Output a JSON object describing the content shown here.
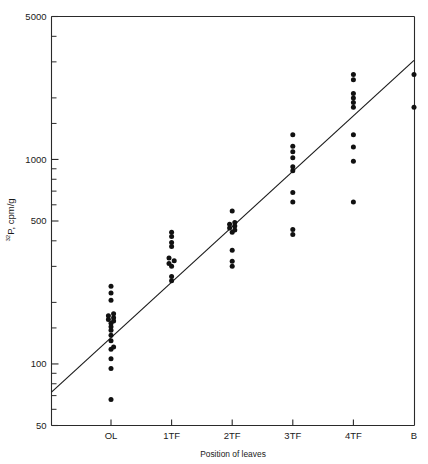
{
  "chart_data": {
    "type": "scatter",
    "title": "",
    "xlabel": "Position of leaves",
    "ylabel": "32P, cpm/g",
    "ylabel_superscript": "32",
    "ylabel_rest": "P, cpm/g",
    "yscale": "log",
    "ylim": [
      50,
      5000
    ],
    "ytick_labels": [
      "5000",
      "1000",
      "500",
      "100",
      "50"
    ],
    "ytick_values": [
      5000,
      1000,
      500,
      100,
      50
    ],
    "yminor_values": [
      4000,
      3000,
      2000,
      1500,
      900,
      800,
      700,
      600,
      400,
      300,
      200,
      150,
      90,
      80,
      70,
      60
    ],
    "categories": [
      "OL",
      "1TF",
      "2TF",
      "3TF",
      "4TF",
      "B"
    ],
    "grid": false,
    "legend": false,
    "series": [
      {
        "name": "32P activity",
        "points": [
          {
            "category": "OL",
            "value": 67
          },
          {
            "category": "OL",
            "value": 95
          },
          {
            "category": "OL",
            "value": 106
          },
          {
            "category": "OL",
            "value": 118
          },
          {
            "category": "OL",
            "value": 121
          },
          {
            "category": "OL",
            "value": 130
          },
          {
            "category": "OL",
            "value": 138
          },
          {
            "category": "OL",
            "value": 146
          },
          {
            "category": "OL",
            "value": 152
          },
          {
            "category": "OL",
            "value": 158
          },
          {
            "category": "OL",
            "value": 162
          },
          {
            "category": "OL",
            "value": 165
          },
          {
            "category": "OL",
            "value": 168
          },
          {
            "category": "OL",
            "value": 172
          },
          {
            "category": "OL",
            "value": 176
          },
          {
            "category": "OL",
            "value": 205
          },
          {
            "category": "OL",
            "value": 222
          },
          {
            "category": "OL",
            "value": 240
          },
          {
            "category": "1TF",
            "value": 255
          },
          {
            "category": "1TF",
            "value": 268
          },
          {
            "category": "1TF",
            "value": 300
          },
          {
            "category": "1TF",
            "value": 310
          },
          {
            "category": "1TF",
            "value": 320
          },
          {
            "category": "1TF",
            "value": 330
          },
          {
            "category": "1TF",
            "value": 375
          },
          {
            "category": "1TF",
            "value": 392
          },
          {
            "category": "1TF",
            "value": 420
          },
          {
            "category": "1TF",
            "value": 440
          },
          {
            "category": "2TF",
            "value": 300
          },
          {
            "category": "2TF",
            "value": 318
          },
          {
            "category": "2TF",
            "value": 360
          },
          {
            "category": "2TF",
            "value": 440
          },
          {
            "category": "2TF",
            "value": 452
          },
          {
            "category": "2TF",
            "value": 462
          },
          {
            "category": "2TF",
            "value": 472
          },
          {
            "category": "2TF",
            "value": 482
          },
          {
            "category": "2TF",
            "value": 492
          },
          {
            "category": "2TF",
            "value": 560
          },
          {
            "category": "3TF",
            "value": 430
          },
          {
            "category": "3TF",
            "value": 455
          },
          {
            "category": "3TF",
            "value": 620
          },
          {
            "category": "3TF",
            "value": 690
          },
          {
            "category": "3TF",
            "value": 880
          },
          {
            "category": "3TF",
            "value": 920
          },
          {
            "category": "3TF",
            "value": 1020
          },
          {
            "category": "3TF",
            "value": 1090
          },
          {
            "category": "3TF",
            "value": 1160
          },
          {
            "category": "3TF",
            "value": 1320
          },
          {
            "category": "4TF",
            "value": 620
          },
          {
            "category": "4TF",
            "value": 980
          },
          {
            "category": "4TF",
            "value": 1150
          },
          {
            "category": "4TF",
            "value": 1320
          },
          {
            "category": "4TF",
            "value": 1800
          },
          {
            "category": "4TF",
            "value": 1900
          },
          {
            "category": "4TF",
            "value": 2000
          },
          {
            "category": "4TF",
            "value": 2100
          },
          {
            "category": "4TF",
            "value": 2450
          },
          {
            "category": "4TF",
            "value": 2600
          },
          {
            "category": "B",
            "value": 1800
          },
          {
            "category": "B",
            "value": 2600
          }
        ]
      }
    ],
    "fit_line": {
      "name": "regression line",
      "x_start_category_index": -1.0,
      "x_end_category_index": 5.0,
      "y_start": 72,
      "y_end": 3050
    }
  }
}
